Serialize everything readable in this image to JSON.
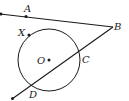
{
  "diagram": {
    "type": "geometry",
    "stroke_color": "#1a1a1a",
    "background": "#ffffff",
    "circle": {
      "center_label": "O",
      "cx": 49,
      "cy": 60,
      "r": 31
    },
    "points": {
      "A": {
        "label": "A",
        "x": 26,
        "y": 16
      },
      "B": {
        "label": "B",
        "x": 113,
        "y": 27
      },
      "C": {
        "label": "C",
        "x": 79,
        "y": 53
      },
      "D": {
        "label": "D",
        "x": 33,
        "y": 87
      },
      "X": {
        "label": "X",
        "x": 29,
        "y": 35
      },
      "O": {
        "label": "O",
        "x": 49,
        "y": 60
      }
    },
    "lines": [
      {
        "name": "tangent-BA",
        "from": "B",
        "through": "A"
      },
      {
        "name": "secant-BCD",
        "from": "B",
        "through": [
          "C",
          "D"
        ]
      }
    ],
    "labels": {
      "A": "A",
      "B": "B",
      "C": "C",
      "D": "D",
      "X": "X",
      "O": "O"
    }
  }
}
